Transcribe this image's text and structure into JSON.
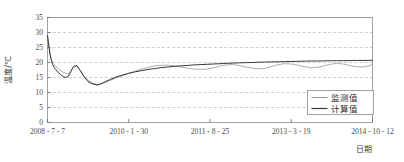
{
  "chart_data": {
    "type": "line",
    "title": "",
    "xlabel": "日期",
    "ylabel": "温度/℃",
    "ylim": [
      0,
      35
    ],
    "yticks": [
      0,
      5,
      10,
      15,
      20,
      25,
      30,
      35
    ],
    "ytick_labels": [
      "0",
      "5",
      "10",
      "15",
      "20",
      "25",
      "30",
      "35"
    ],
    "xtick_labels": [
      "2008 - 7 - 7",
      "2010 - 1 - 30",
      "2011 - 8 - 25",
      "2013 - 3 - 19",
      "2014 - 10 - 12"
    ],
    "xtick_positions": [
      0.0,
      0.25,
      0.5,
      0.75,
      1.0
    ],
    "grid": "horizontal-dashed",
    "legend_position": "bottom-right",
    "series": [
      {
        "name": "监测值",
        "color": "#8a8a8a",
        "width": 0.7,
        "x": [
          0.0,
          0.004,
          0.008,
          0.012,
          0.016,
          0.02,
          0.026,
          0.032,
          0.04,
          0.048,
          0.056,
          0.064,
          0.072,
          0.08,
          0.09,
          0.1,
          0.112,
          0.125,
          0.14,
          0.155,
          0.17,
          0.19,
          0.21,
          0.23,
          0.25,
          0.27,
          0.29,
          0.31,
          0.33,
          0.35,
          0.37,
          0.39,
          0.41,
          0.43,
          0.45,
          0.47,
          0.49,
          0.51,
          0.53,
          0.55,
          0.57,
          0.59,
          0.61,
          0.63,
          0.65,
          0.67,
          0.69,
          0.71,
          0.73,
          0.75,
          0.77,
          0.79,
          0.81,
          0.83,
          0.85,
          0.87,
          0.89,
          0.91,
          0.93,
          0.95,
          0.97,
          0.99,
          1.0
        ],
        "y": [
          29.0,
          26.0,
          23.0,
          21.0,
          20.0,
          19.2,
          18.6,
          18.0,
          17.4,
          16.8,
          16.4,
          16.2,
          17.2,
          18.4,
          18.9,
          17.6,
          15.6,
          14.0,
          13.1,
          12.6,
          13.0,
          13.9,
          14.8,
          15.6,
          16.4,
          17.1,
          17.8,
          18.4,
          18.9,
          19.1,
          19.1,
          18.9,
          18.5,
          18.1,
          17.8,
          17.7,
          17.8,
          18.2,
          18.8,
          19.2,
          19.3,
          19.0,
          18.5,
          18.1,
          17.9,
          18.1,
          18.7,
          19.3,
          19.6,
          19.5,
          19.1,
          18.6,
          18.3,
          18.4,
          18.9,
          19.4,
          19.7,
          19.5,
          19.0,
          18.6,
          18.5,
          18.9,
          19.4
        ]
      },
      {
        "name": "计算值",
        "color": "#383838",
        "width": 1.0,
        "x": [
          0.0,
          0.004,
          0.008,
          0.012,
          0.016,
          0.02,
          0.026,
          0.032,
          0.04,
          0.048,
          0.056,
          0.064,
          0.072,
          0.08,
          0.09,
          0.1,
          0.112,
          0.125,
          0.14,
          0.155,
          0.17,
          0.19,
          0.21,
          0.23,
          0.25,
          0.27,
          0.29,
          0.31,
          0.33,
          0.35,
          0.37,
          0.39,
          0.41,
          0.43,
          0.45,
          0.47,
          0.49,
          0.51,
          0.53,
          0.55,
          0.57,
          0.59,
          0.61,
          0.63,
          0.65,
          0.67,
          0.69,
          0.71,
          0.73,
          0.75,
          0.77,
          0.79,
          0.81,
          0.83,
          0.85,
          0.87,
          0.89,
          0.91,
          0.93,
          0.95,
          0.97,
          0.99,
          1.0
        ],
        "y": [
          29.0,
          25.5,
          22.5,
          20.6,
          19.3,
          18.4,
          17.6,
          16.8,
          16.0,
          15.3,
          15.0,
          15.4,
          17.0,
          18.7,
          19.0,
          17.4,
          15.3,
          13.6,
          12.8,
          12.5,
          13.2,
          14.2,
          15.1,
          15.8,
          16.4,
          16.9,
          17.3,
          17.7,
          18.0,
          18.3,
          18.5,
          18.7,
          18.9,
          19.0,
          19.2,
          19.3,
          19.4,
          19.5,
          19.6,
          19.7,
          19.8,
          19.9,
          19.95,
          20.0,
          20.1,
          20.15,
          20.2,
          20.25,
          20.3,
          20.35,
          20.4,
          20.45,
          20.5,
          20.5,
          20.55,
          20.6,
          20.6,
          20.6,
          20.65,
          20.7,
          20.7,
          20.7,
          20.75
        ]
      }
    ]
  },
  "legend": {
    "items": [
      {
        "label": "监测值"
      },
      {
        "label": "计算值"
      }
    ]
  },
  "axes": {
    "y_title": "温度/℃",
    "x_title": "日期"
  }
}
